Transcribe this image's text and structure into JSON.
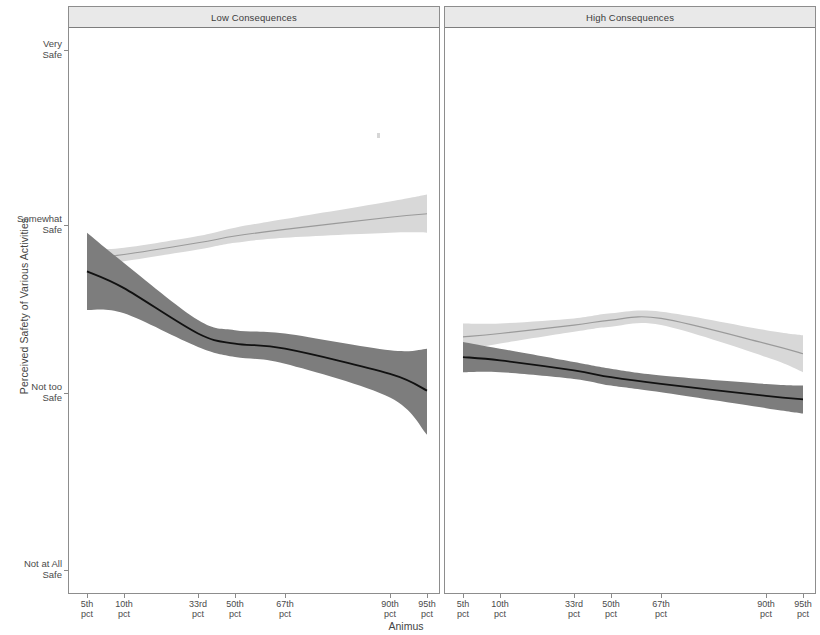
{
  "figure": {
    "width": 812,
    "height": 635,
    "background": "#ffffff"
  },
  "axis_title_y": "Perceived Safety of Various Activities",
  "axis_title_x": "Animus",
  "panels": [
    {
      "label": "Low Consequences"
    },
    {
      "label": "High Consequences"
    }
  ],
  "y_tick_labels": [
    "Very\nSafe",
    "Somewhat\nSafe",
    "Not too\nSafe",
    "Not at All\nSafe"
  ],
  "x_tick_labels": [
    "5th\npct",
    "10th\npct",
    "33rd\npct",
    "50th\npct",
    "67th\npct",
    "90th\npct",
    "95th\npct"
  ],
  "colors": {
    "dark_band": "#7d7d7d",
    "dark_line": "#111111",
    "light_band": "#d8d8d8",
    "light_line": "#9a9a9a",
    "panel_border": "#8d8d8d",
    "strip_background": "#e9e9e9",
    "text": "#444444"
  },
  "chart_data": {
    "type": "line",
    "title": "",
    "subtitle": "",
    "xlabel": "Animus",
    "ylabel": "Perceived Safety of Various Activities",
    "facet_variable": "Consequences",
    "facets": [
      "Low Consequences",
      "High Consequences"
    ],
    "grid": false,
    "legend_position": "none",
    "x": [
      5,
      10,
      33,
      50,
      67,
      90,
      95
    ],
    "x_tick_labels": [
      "5th pct",
      "10th pct",
      "33rd pct",
      "50th pct",
      "67th pct",
      "90th pct",
      "95th pct"
    ],
    "y_tick_labels": [
      "Not at All Safe",
      "Not too Safe",
      "Somewhat Safe",
      "Very Safe"
    ],
    "y_tick_values": [
      1,
      2,
      3,
      4
    ],
    "ylim": [
      1,
      4
    ],
    "xlim": [
      5,
      95
    ],
    "series": [
      {
        "name": "Dark series",
        "line_color": "#111111",
        "band_color": "#7d7d7d",
        "facet_values": {
          "Low Consequences": {
            "x": [
              5,
              10,
              33,
              50,
              67,
              90,
              95
            ],
            "fit": [
              2.73,
              2.63,
              2.36,
              2.3,
              2.27,
              2.12,
              2.02
            ],
            "lower": [
              2.5,
              2.48,
              2.28,
              2.22,
              2.18,
              1.98,
              1.77
            ],
            "upper": [
              2.96,
              2.78,
              2.44,
              2.38,
              2.36,
              2.26,
              2.27
            ]
          },
          "High Consequences": {
            "x": [
              5,
              10,
              33,
              50,
              67,
              90,
              95
            ],
            "fit": [
              2.22,
              2.2,
              2.14,
              2.1,
              2.06,
              1.99,
              1.97
            ],
            "lower": [
              2.13,
              2.13,
              2.09,
              2.05,
              2.01,
              1.92,
              1.89
            ],
            "upper": [
              2.31,
              2.27,
              2.19,
              2.15,
              2.11,
              2.06,
              2.05
            ]
          }
        }
      },
      {
        "name": "Light series",
        "line_color": "#9a9a9a",
        "band_color": "#d8d8d8",
        "facet_values": {
          "Low Consequences": {
            "x": [
              5,
              10,
              33,
              50,
              67,
              90,
              95
            ],
            "fit": [
              2.81,
              2.83,
              2.9,
              2.94,
              2.98,
              3.05,
              3.07
            ],
            "lower": [
              2.76,
              2.79,
              2.86,
              2.9,
              2.93,
              2.96,
              2.96
            ],
            "upper": [
              2.86,
              2.87,
              2.94,
              2.99,
              3.04,
              3.14,
              3.18
            ]
          },
          "High Consequences": {
            "x": [
              5,
              10,
              33,
              50,
              67,
              90,
              95
            ],
            "fit": [
              2.34,
              2.36,
              2.41,
              2.44,
              2.45,
              2.3,
              2.24
            ],
            "lower": [
              2.26,
              2.3,
              2.37,
              2.4,
              2.41,
              2.22,
              2.13
            ],
            "upper": [
              2.42,
              2.42,
              2.45,
              2.48,
              2.49,
              2.38,
              2.35
            ]
          }
        }
      }
    ]
  }
}
